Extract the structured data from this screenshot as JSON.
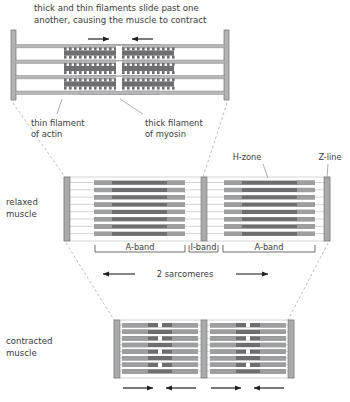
{
  "figure": {
    "caption_line1": "thick and thin filaments slide past one",
    "caption_line2": "another, causing the muscle to contract",
    "labels": {
      "thin_filament_line1": "thin filament",
      "thin_filament_line2": "of actin",
      "thick_filament_line1": "thick filament",
      "thick_filament_line2": "of myosin",
      "h_zone": "H-zone",
      "z_line": "Z-line",
      "relaxed_line1": "relaxed",
      "relaxed_line2": "muscle",
      "contracted_line1": "contracted",
      "contracted_line2": "muscle",
      "a_band_left": "A-band",
      "i_band": "I-band",
      "a_band_right": "A-band",
      "sarcomeres": "2 sarcomeres"
    },
    "colors": {
      "myosin": "#6e6e70",
      "actin": "#b6b7b9",
      "z_line": "#a9aaac",
      "outline": "#5a5a5c",
      "text": "#3b3b3d",
      "background": "#ffffff"
    },
    "panels": [
      {
        "name": "magnified-sarcomere",
        "arrows": 2
      },
      {
        "name": "relaxed-muscle",
        "sarcomeres": 2,
        "filament_rows": 8
      },
      {
        "name": "contracted-muscle",
        "sarcomeres": 2,
        "filament_rows": 8,
        "arrows": 4
      }
    ]
  }
}
